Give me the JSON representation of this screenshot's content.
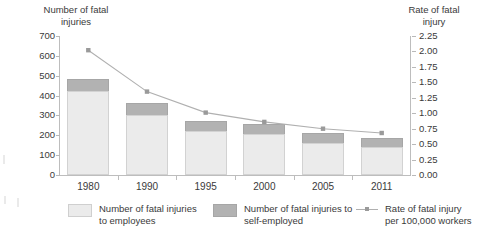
{
  "chart_data": {
    "type": "bar",
    "title": "",
    "categories": [
      "1980",
      "1990",
      "1995",
      "2000",
      "2005",
      "2011"
    ],
    "series": [
      {
        "name": "Number of fatal injuries to employees",
        "values": [
          425,
          300,
          222,
          205,
          162,
          143
        ],
        "color": "#ebebeb",
        "axis": "left"
      },
      {
        "name": "Number of fatal injuries to self-employed",
        "values": [
          60,
          62,
          50,
          52,
          50,
          42
        ],
        "color": "#b2b2b2",
        "axis": "left"
      },
      {
        "name": "Rate of fatal injury per 100,000 workers",
        "values": [
          2.02,
          1.35,
          1.01,
          0.86,
          0.75,
          0.68
        ],
        "color": "#b0b0b0",
        "axis": "right",
        "type": "line"
      }
    ],
    "totals": [
      485,
      362,
      272,
      257,
      212,
      185
    ],
    "stacked": true,
    "xlabel": "",
    "ylabel": "Number of fatal injuries",
    "y2label": "Rate of fatal injury",
    "ylim": [
      0,
      700
    ],
    "y2lim": [
      0,
      2.25
    ],
    "yticks": [
      "700",
      "600",
      "500",
      "400",
      "300",
      "200",
      "100",
      "0"
    ],
    "y2ticks": [
      "2.25",
      "2.00",
      "1.75",
      "1.50",
      "1.25",
      "1.00",
      "0.75",
      "0.50",
      "0.25",
      "0.00"
    ],
    "grid": false,
    "legend_position": "bottom"
  },
  "axes": {
    "left_title": "Number of fatal\ninjuries",
    "right_title": "Rate of fatal\ninjury"
  },
  "legend": {
    "employees": "Number of fatal injuries\nto employees",
    "self_employed": "Number of fatal injuries to\nself-employed",
    "rate": "Rate of fatal injury\nper 100,000 workers"
  }
}
